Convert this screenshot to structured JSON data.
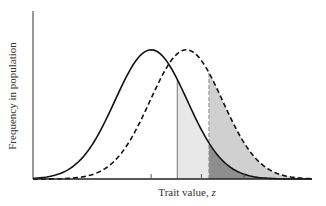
{
  "chart_data": {
    "type": "area",
    "title": "",
    "xlabel": "Trait value, z",
    "xlabel_text": "Trait value, ",
    "xlabel_var": "z",
    "ylabel": "Frequency in population",
    "grid": false,
    "legend": null,
    "series": [
      {
        "name": "original distribution",
        "style": "solid",
        "color": "#111111",
        "mean": 0.0,
        "sd": 1.0,
        "peak": 1.0
      },
      {
        "name": "shifted distribution",
        "style": "dashed",
        "color": "#111111",
        "mean": 0.7,
        "sd": 1.0,
        "peak": 1.0
      }
    ],
    "thresholds": [
      {
        "name": "truncation point (solid line)",
        "style": "solid",
        "x": 0.52,
        "color": "#777777"
      },
      {
        "name": "truncation point (dashed line)",
        "style": "dashed",
        "x": 1.15,
        "color": "#888888"
      }
    ],
    "shaded_regions": [
      {
        "name": "selected tail of original",
        "from": 0.52,
        "to": 1.15,
        "under": "original",
        "color": "#e6e6e6"
      },
      {
        "name": "selected tail of shifted (upper)",
        "from": 1.15,
        "to": 2.5,
        "under": "shifted",
        "color": "#cfcfcf"
      },
      {
        "name": "overlap under original beyond second threshold",
        "from": 1.15,
        "to": 1.85,
        "under": "original",
        "color": "#8c8c8c"
      }
    ],
    "x_ticks": [
      0.0,
      1.0,
      1.85
    ],
    "x_tick_labels": [
      "",
      "",
      ""
    ],
    "xlim": [
      -2.35,
      3.2
    ],
    "ylim": [
      0,
      1.3
    ]
  }
}
